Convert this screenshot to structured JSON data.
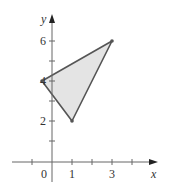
{
  "axes": {
    "x_label": "x",
    "y_label": "y",
    "x_ticks": [
      {
        "value": -1,
        "label": ""
      },
      {
        "value": 0,
        "label": "0"
      },
      {
        "value": 1,
        "label": "1"
      },
      {
        "value": 2,
        "label": ""
      },
      {
        "value": 3,
        "label": "3"
      },
      {
        "value": 4,
        "label": ""
      }
    ],
    "y_ticks": [
      {
        "value": 1,
        "label": ""
      },
      {
        "value": 2,
        "label": "2"
      },
      {
        "value": 3,
        "label": ""
      },
      {
        "value": 4,
        "label": "4"
      },
      {
        "value": 5,
        "label": ""
      },
      {
        "value": 6,
        "label": "6"
      }
    ]
  },
  "triangle": {
    "vertices": [
      [
        -0.5,
        4
      ],
      [
        1,
        2
      ],
      [
        3,
        6
      ]
    ],
    "fill": "#e4e4e4",
    "stroke": "#555555"
  },
  "colors": {
    "axis": "#666666",
    "text": "#333333"
  }
}
